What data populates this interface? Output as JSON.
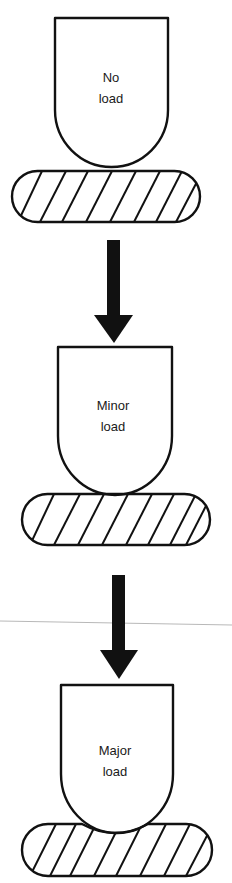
{
  "diagram": {
    "stages": [
      {
        "label_line1": "No",
        "label_line2": "load"
      },
      {
        "label_line1": "Minor",
        "label_line2": "load"
      },
      {
        "label_line1": "Major",
        "label_line2": "load"
      }
    ],
    "colors": {
      "ink": "#111111",
      "background": "#ffffff",
      "scan_line": "#b8b8b8"
    }
  }
}
